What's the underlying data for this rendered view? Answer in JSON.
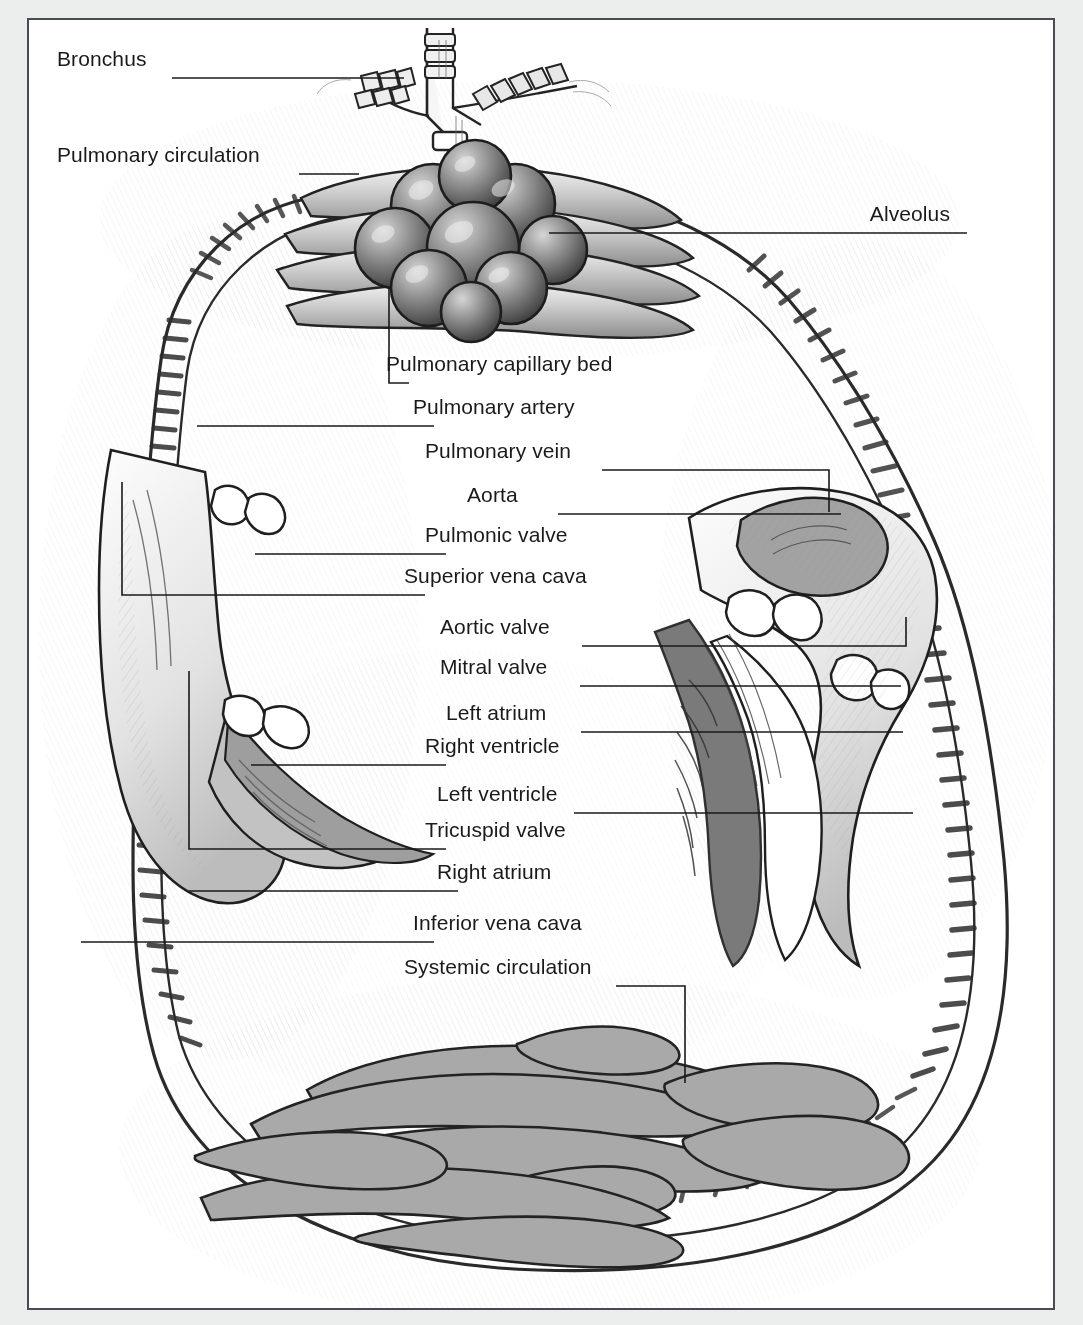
{
  "figure": {
    "frame_color": "#4a4a52",
    "page_background": "#eceded",
    "plate_background": "#ffffff",
    "ink_color": "#1a1a1a",
    "vessel_fill": "#a9a9a9",
    "shading_color": "#b8b8b8"
  },
  "labels": [
    {
      "id": "bronchus",
      "text": "Bronchus",
      "align": "left",
      "x": 57,
      "y": 58,
      "line": [
        [
          143,
          58
        ],
        [
          375,
          58
        ]
      ]
    },
    {
      "id": "pulmonary-circulation",
      "text": "Pulmonary circulation",
      "align": "left",
      "x": 57,
      "y": 154,
      "line": [
        [
          270,
          154
        ],
        [
          330,
          154
        ]
      ]
    },
    {
      "id": "alveolus",
      "text": "Alveolus",
      "align": "right",
      "x": 950,
      "y": 213,
      "line": [
        [
          520,
          213
        ],
        [
          938,
          213
        ]
      ]
    },
    {
      "id": "pulmonary-capillary-bed",
      "text": "Pulmonary capillary bed",
      "align": "left",
      "x": 386,
      "y": 363,
      "line": [
        [
          360,
          268
        ],
        [
          360,
          363
        ],
        [
          380,
          363
        ]
      ]
    },
    {
      "id": "pulmonary-artery",
      "text": "Pulmonary artery",
      "align": "left",
      "x": 413,
      "y": 406,
      "line": [
        [
          168,
          406
        ],
        [
          405,
          406
        ]
      ]
    },
    {
      "id": "pulmonary-vein",
      "text": "Pulmonary vein",
      "align": "left",
      "x": 425,
      "y": 450,
      "line": [
        [
          573,
          450
        ],
        [
          800,
          450
        ],
        [
          800,
          492
        ]
      ]
    },
    {
      "id": "aorta",
      "text": "Aorta",
      "align": "left",
      "x": 467,
      "y": 494,
      "line": [
        [
          529,
          494
        ],
        [
          812,
          494
        ]
      ]
    },
    {
      "id": "pulmonic-valve",
      "text": "Pulmonic valve",
      "align": "left",
      "x": 425,
      "y": 534,
      "line": [
        [
          226,
          534
        ],
        [
          417,
          534
        ]
      ]
    },
    {
      "id": "superior-vena-cava",
      "text": "Superior vena cava",
      "align": "left",
      "x": 404,
      "y": 575,
      "line": [
        [
          93,
          462
        ],
        [
          93,
          575
        ],
        [
          396,
          575
        ]
      ]
    },
    {
      "id": "aortic-valve",
      "text": "Aortic valve",
      "align": "left",
      "x": 440,
      "y": 626,
      "line": [
        [
          553,
          626
        ],
        [
          877,
          626
        ],
        [
          877,
          597
        ]
      ]
    },
    {
      "id": "mitral-valve",
      "text": "Mitral valve",
      "align": "left",
      "x": 440,
      "y": 666,
      "line": [
        [
          551,
          666
        ],
        [
          872,
          666
        ]
      ]
    },
    {
      "id": "left-atrium",
      "text": "Left atrium",
      "align": "left",
      "x": 446,
      "y": 712,
      "line": [
        [
          552,
          712
        ],
        [
          874,
          712
        ]
      ]
    },
    {
      "id": "right-ventricle",
      "text": "Right ventricle",
      "align": "left",
      "x": 425,
      "y": 745,
      "line": [
        [
          222,
          745
        ],
        [
          417,
          745
        ]
      ]
    },
    {
      "id": "left-ventricle",
      "text": "Left ventricle",
      "align": "left",
      "x": 437,
      "y": 793,
      "line": [
        [
          545,
          793
        ],
        [
          884,
          793
        ]
      ]
    },
    {
      "id": "tricuspid-valve",
      "text": "Tricuspid valve",
      "align": "left",
      "x": 425,
      "y": 829,
      "line": [
        [
          160,
          651
        ],
        [
          160,
          829
        ],
        [
          417,
          829
        ]
      ]
    },
    {
      "id": "right-atrium",
      "text": "Right atrium",
      "align": "left",
      "x": 437,
      "y": 871,
      "line": [
        [
          160,
          871
        ],
        [
          429,
          871
        ]
      ]
    },
    {
      "id": "inferior-vena-cava",
      "text": "Inferior vena cava",
      "align": "left",
      "x": 413,
      "y": 922,
      "line": [
        [
          52,
          922
        ],
        [
          405,
          922
        ]
      ]
    },
    {
      "id": "systemic-circulation",
      "text": "Systemic circulation",
      "align": "left",
      "x": 404,
      "y": 966,
      "line": [
        [
          587,
          966
        ],
        [
          656,
          966
        ],
        [
          656,
          1063
        ]
      ]
    }
  ],
  "illustration": {
    "parts": [
      "bronchus-tree",
      "alveolus-cluster",
      "pulmonary-capillary-bed",
      "pulmonary-artery-vessel",
      "pulmonary-vein-vessel",
      "aorta-arch",
      "superior-vena-cava-vessel",
      "inferior-vena-cava-vessel",
      "right-atrium-chamber",
      "right-ventricle-chamber",
      "left-atrium-chamber",
      "left-ventricle-chamber",
      "tricuspid-valve-leaflets",
      "pulmonic-valve-leaflets",
      "mitral-valve-leaflets",
      "aortic-valve-leaflets",
      "systemic-capillary-bed"
    ]
  }
}
